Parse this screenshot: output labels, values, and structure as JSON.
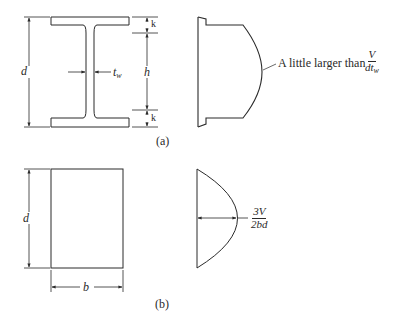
{
  "figure": {
    "part_a": {
      "caption": "(a)",
      "section": "I-beam (wide-flange) cross section",
      "labels": {
        "depth": "d",
        "web_thickness": "t",
        "web_thickness_sub": "w",
        "web_height": "h",
        "fillet_top": "k",
        "fillet_bottom": "k"
      },
      "stress_diagram": {
        "shape": "shear stress distribution over I-section",
        "annotation_prefix": "A little larger than",
        "annotation_fraction": {
          "numerator": "V",
          "denominator": "dt",
          "denominator_sub": "w"
        }
      }
    },
    "part_b": {
      "caption": "(b)",
      "section": "Rectangular cross section",
      "labels": {
        "depth": "d",
        "width": "b"
      },
      "stress_diagram": {
        "shape": "parabolic shear stress distribution",
        "annotation_fraction": {
          "numerator": "3V",
          "denominator": "2bd"
        }
      }
    },
    "colors": {
      "line": "#2a2a2a",
      "background": "#ffffff"
    }
  }
}
